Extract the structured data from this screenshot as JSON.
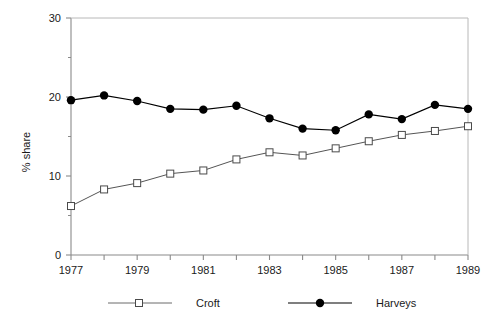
{
  "chart_data": {
    "type": "line",
    "title": "",
    "subtitle": "",
    "xlabel": "",
    "ylabel": "% share",
    "x": [
      1977,
      1978,
      1979,
      1980,
      1981,
      1982,
      1983,
      1984,
      1985,
      1986,
      1987,
      1988,
      1989
    ],
    "xtick_labels": [
      "1977",
      "",
      "1979",
      "",
      "1981",
      "",
      "1983",
      "",
      "1985",
      "",
      "1987",
      "",
      "1989"
    ],
    "ytick_labels": [
      "0",
      "10",
      "20",
      "30"
    ],
    "ytick_values": [
      0,
      10,
      20,
      30
    ],
    "yminor_values": [
      5,
      15,
      25
    ],
    "xlim": [
      1977,
      1989
    ],
    "ylim": [
      0,
      30
    ],
    "grid": false,
    "legend_position": "bottom",
    "series": [
      {
        "name": "Croft",
        "marker": "open-square",
        "color": "#555555",
        "values": [
          6.2,
          8.3,
          9.1,
          10.3,
          10.7,
          12.1,
          13.0,
          12.6,
          13.5,
          14.4,
          15.2,
          15.7,
          16.3
        ]
      },
      {
        "name": "Harveys",
        "marker": "filled-circle",
        "color": "#000000",
        "values": [
          19.6,
          20.2,
          19.5,
          18.5,
          18.4,
          18.9,
          17.3,
          16.0,
          15.8,
          17.8,
          17.2,
          19.0,
          18.5
        ]
      }
    ]
  },
  "legend": {
    "entries": [
      {
        "label": "Croft"
      },
      {
        "label": "Harveys"
      }
    ]
  },
  "colors": {
    "axis": "#888888",
    "croft_line": "#6b6b6b",
    "harveys_line": "#000000",
    "text": "#1a1a1a"
  }
}
